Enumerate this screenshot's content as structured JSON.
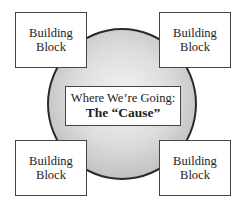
{
  "diagram": {
    "center": {
      "line1": "Where We’re Going:",
      "line2": "The “Cause”"
    },
    "blocks": [
      {
        "position": "top-left",
        "line1": "Building",
        "line2": "Block"
      },
      {
        "position": "top-right",
        "line1": "Building",
        "line2": "Block"
      },
      {
        "position": "bottom-left",
        "line1": "Building",
        "line2": "Block"
      },
      {
        "position": "bottom-right",
        "line1": "Building",
        "line2": "Block"
      }
    ],
    "colors": {
      "circle_fill": "#c8c8c8",
      "circle_border": "#2a2a2a",
      "box_fill": "#ffffff",
      "box_border": "#444444"
    }
  }
}
